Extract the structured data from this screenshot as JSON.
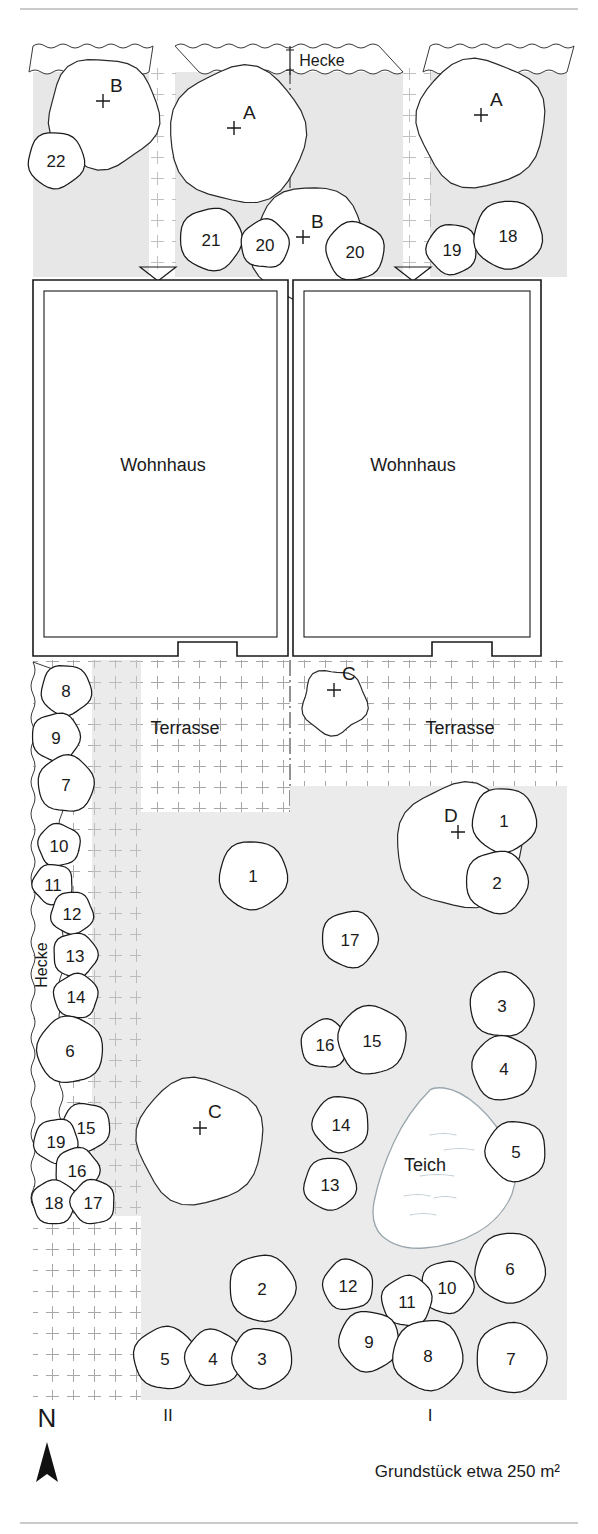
{
  "caption": "Grundstück etwa 250 m²",
  "compass": {
    "letter": "N",
    "icon": "north-arrow-icon"
  },
  "sections": [
    {
      "id": "sec-2",
      "label": "II",
      "x": 168,
      "y": 1421
    },
    {
      "id": "sec-1",
      "label": "I",
      "x": 430,
      "y": 1421
    }
  ],
  "areas": {
    "house_left": {
      "label": "Wohnhaus",
      "x": 163,
      "y": 465
    },
    "house_right": {
      "label": "Wohnhaus",
      "x": 413,
      "y": 465
    },
    "terrasse_left": {
      "label": "Terrasse",
      "x": 185,
      "y": 728
    },
    "terrasse_right": {
      "label": "Terrasse",
      "x": 460,
      "y": 728
    },
    "teich": {
      "label": "Teich",
      "x": 425,
      "y": 1165
    },
    "hecke_top": {
      "label": "Hecke",
      "x": 322,
      "y": 61
    },
    "hecke_left": {
      "label": "Hecke",
      "x": 42,
      "y": 965
    }
  },
  "group_markers": [
    {
      "label": "B",
      "lx": 110,
      "ly": 92,
      "cx": 103,
      "cy": 101
    },
    {
      "label": "A",
      "lx": 243,
      "ly": 119,
      "cx": 234,
      "cy": 128
    },
    {
      "label": "A",
      "lx": 490,
      "ly": 106,
      "cx": 481,
      "cy": 115
    },
    {
      "label": "B",
      "lx": 311,
      "ly": 228,
      "cx": 303,
      "cy": 237
    },
    {
      "label": "C",
      "lx": 342,
      "ly": 680,
      "cx": 334,
      "cy": 690
    },
    {
      "label": "D",
      "lx": 444,
      "ly": 822,
      "cx": 458,
      "cy": 832
    },
    {
      "label": "C",
      "lx": 208,
      "ly": 1118,
      "cx": 200,
      "cy": 1128
    }
  ],
  "trees_front": [
    {
      "n": "22",
      "cx": 56,
      "cy": 160,
      "r": 28
    },
    {
      "n": "21",
      "cx": 211,
      "cy": 239,
      "r": 31
    },
    {
      "n": "20",
      "cx": 265,
      "cy": 244,
      "r": 24
    },
    {
      "n": "20",
      "cx": 355,
      "cy": 251,
      "r": 29
    },
    {
      "n": "19",
      "cx": 452,
      "cy": 249,
      "r": 25
    },
    {
      "n": "18",
      "cx": 508,
      "cy": 235,
      "r": 34
    }
  ],
  "canopies_front": [
    {
      "cx": 103,
      "cy": 113,
      "r": 55
    },
    {
      "cx": 238,
      "cy": 135,
      "r": 68
    },
    {
      "cx": 481,
      "cy": 123,
      "r": 64
    },
    {
      "cx": 310,
      "cy": 245,
      "r": 58
    }
  ],
  "trees_garden_left": [
    {
      "n": "8",
      "cx": 66,
      "cy": 690,
      "r": 25
    },
    {
      "n": "9",
      "cx": 56,
      "cy": 737,
      "r": 24
    },
    {
      "n": "7",
      "cx": 66,
      "cy": 784,
      "r": 28
    },
    {
      "n": "10",
      "cx": 59,
      "cy": 845,
      "r": 21
    },
    {
      "n": "11",
      "cx": 53,
      "cy": 884,
      "r": 20
    },
    {
      "n": "12",
      "cx": 72,
      "cy": 913,
      "r": 21
    },
    {
      "n": "13",
      "cx": 75,
      "cy": 955,
      "r": 22
    },
    {
      "n": "14",
      "cx": 76,
      "cy": 996,
      "r": 22
    },
    {
      "n": "6",
      "cx": 70,
      "cy": 1050,
      "r": 33
    },
    {
      "n": "15",
      "cx": 86,
      "cy": 1127,
      "r": 24
    },
    {
      "n": "19",
      "cx": 56,
      "cy": 1141,
      "r": 22
    },
    {
      "n": "16",
      "cx": 77,
      "cy": 1170,
      "r": 22
    },
    {
      "n": "18",
      "cx": 54,
      "cy": 1202,
      "r": 22
    },
    {
      "n": "17",
      "cx": 93,
      "cy": 1202,
      "r": 22
    }
  ],
  "trees_garden_mid": [
    {
      "n": "1",
      "cx": 253,
      "cy": 875,
      "r": 34
    },
    {
      "n": "17",
      "cx": 350,
      "cy": 939,
      "r": 28
    },
    {
      "n": "16",
      "cx": 325,
      "cy": 1044,
      "r": 24
    },
    {
      "n": "15",
      "cx": 372,
      "cy": 1040,
      "r": 34
    },
    {
      "n": "14",
      "cx": 341,
      "cy": 1124,
      "r": 28
    },
    {
      "n": "13",
      "cx": 330,
      "cy": 1184,
      "r": 26
    },
    {
      "n": "2",
      "cx": 262,
      "cy": 1288,
      "r": 33
    },
    {
      "n": "5",
      "cx": 165,
      "cy": 1358,
      "r": 31
    },
    {
      "n": "4",
      "cx": 213,
      "cy": 1358,
      "r": 28
    },
    {
      "n": "3",
      "cx": 262,
      "cy": 1358,
      "r": 30
    }
  ],
  "trees_garden_right": [
    {
      "n": "1",
      "cx": 504,
      "cy": 820,
      "r": 32
    },
    {
      "n": "2",
      "cx": 497,
      "cy": 882,
      "r": 31
    },
    {
      "n": "3",
      "cx": 502,
      "cy": 1005,
      "r": 32
    },
    {
      "n": "4",
      "cx": 504,
      "cy": 1068,
      "r": 32
    },
    {
      "n": "5",
      "cx": 516,
      "cy": 1151,
      "r": 30
    },
    {
      "n": "6",
      "cx": 510,
      "cy": 1268,
      "r": 35
    },
    {
      "n": "10",
      "cx": 447,
      "cy": 1287,
      "r": 26
    },
    {
      "n": "11",
      "cx": 407,
      "cy": 1301,
      "r": 25
    },
    {
      "n": "12",
      "cx": 348,
      "cy": 1285,
      "r": 25
    },
    {
      "n": "9",
      "cx": 369,
      "cy": 1341,
      "r": 30
    },
    {
      "n": "8",
      "cx": 428,
      "cy": 1355,
      "r": 35
    },
    {
      "n": "7",
      "cx": 511,
      "cy": 1358,
      "r": 35
    }
  ],
  "canopies_garden": [
    {
      "cx": 334,
      "cy": 702,
      "r": 32
    },
    {
      "cx": 459,
      "cy": 846,
      "r": 62
    },
    {
      "cx": 200,
      "cy": 1141,
      "r": 63
    }
  ],
  "colors": {
    "line": "#1a1a1a",
    "shade": "#e8e8e8",
    "hatch": "#9a9a9a",
    "water": "#ffffff",
    "background": "#ffffff"
  }
}
